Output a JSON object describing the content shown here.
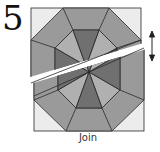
{
  "step": {
    "number": "5",
    "caption": "Join"
  },
  "colors": {
    "background_corner": "#ececec",
    "medium_gray": "#9a9a9a",
    "light_gray": "#b0b0b0",
    "dark_gray": "#707070",
    "outline": "#2a2a2a",
    "gap": "#ffffff"
  },
  "icons": {
    "join_arrow": "double-headed vertical arrow (↕)"
  }
}
